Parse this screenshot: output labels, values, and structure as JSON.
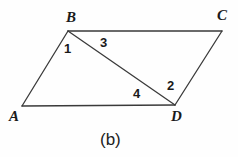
{
  "figure": {
    "caption": "(b)",
    "background_color": "#fefefe",
    "stroke_color": "#3a3a3a",
    "text_color": "#1a1a1a",
    "vertices": [
      {
        "name": "A",
        "label": "A",
        "x": 22,
        "y": 106,
        "label_x": 9,
        "label_y": 109
      },
      {
        "name": "B",
        "label": "B",
        "x": 68,
        "y": 31,
        "label_x": 66,
        "label_y": 10
      },
      {
        "name": "C",
        "label": "C",
        "x": 222,
        "y": 31,
        "label_x": 217,
        "label_y": 8
      },
      {
        "name": "D",
        "label": "D",
        "x": 175,
        "y": 105,
        "label_x": 171,
        "label_y": 109
      }
    ],
    "edges": [
      {
        "name": "edge-AB",
        "from": "A",
        "to": "B"
      },
      {
        "name": "edge-BC",
        "from": "B",
        "to": "C"
      },
      {
        "name": "edge-CD",
        "from": "C",
        "to": "D"
      },
      {
        "name": "edge-AD",
        "from": "A",
        "to": "D"
      },
      {
        "name": "diagonal-BD",
        "from": "B",
        "to": "D"
      }
    ],
    "angle_labels": [
      {
        "name": "angle-1",
        "label": "1",
        "x": 64,
        "y": 42
      },
      {
        "name": "angle-3",
        "label": "3",
        "x": 100,
        "y": 36
      },
      {
        "name": "angle-2",
        "label": "2",
        "x": 167,
        "y": 79
      },
      {
        "name": "angle-4",
        "label": "4",
        "x": 133,
        "y": 87
      }
    ]
  }
}
